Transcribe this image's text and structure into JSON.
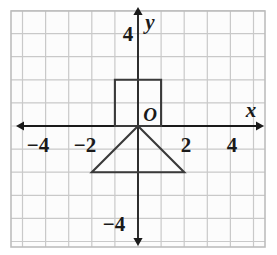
{
  "figure": {
    "width": 277,
    "height": 255,
    "background": "#ffffff"
  },
  "colors": {
    "grid_line": "#c9c9c9",
    "grid_border": "#bdbdbd",
    "axis": "#1a1a1a",
    "shape_stroke": "#3a3a3a",
    "text": "#1a1a1a",
    "plot_background": "#fcfcfc"
  },
  "axes": {
    "x_label": "x",
    "y_label": "y",
    "origin_label": "O",
    "x_ticks": [
      {
        "value": -4,
        "label": "−4"
      },
      {
        "value": -2,
        "label": "−2"
      },
      {
        "value": 2,
        "label": "2"
      },
      {
        "value": 4,
        "label": "4"
      }
    ],
    "y_ticks": [
      {
        "value": 4,
        "label": "4"
      },
      {
        "value": -4,
        "label": "−4"
      }
    ],
    "xlim": [
      -5.5,
      5.5
    ],
    "ylim": [
      -5,
      5
    ],
    "grid": true,
    "arrows": [
      "left",
      "right",
      "up",
      "down"
    ]
  },
  "chart_data": {
    "type": "scatter",
    "title": "",
    "xlabel": "x",
    "ylabel": "y",
    "xlim": [
      -5.5,
      5.5
    ],
    "ylim": [
      -5,
      5
    ],
    "grid": true,
    "legend": "none",
    "shapes": [
      {
        "name": "square",
        "closed": true,
        "fill": "none",
        "points": [
          [
            -1,
            0
          ],
          [
            -1,
            2
          ],
          [
            1,
            2
          ],
          [
            1,
            0
          ]
        ]
      },
      {
        "name": "triangle",
        "closed": true,
        "fill": "none",
        "points": [
          [
            0,
            0
          ],
          [
            -2,
            -2
          ],
          [
            2,
            -2
          ]
        ]
      }
    ],
    "annotations": [
      {
        "text": "O",
        "x": 0.25,
        "y": 0.55
      },
      {
        "text": "x",
        "x": 4.75,
        "y": 0.65
      },
      {
        "text": "y",
        "x": 0.45,
        "y": 4.65
      }
    ]
  }
}
